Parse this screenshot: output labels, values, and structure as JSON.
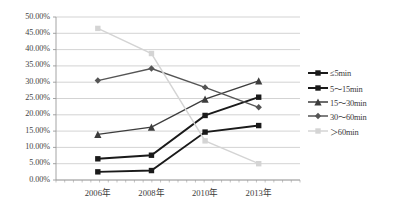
{
  "chart_data": {
    "type": "line",
    "title": "",
    "xlabel": "",
    "ylabel": "",
    "categories": [
      "2006年",
      "2008年",
      "2010年",
      "2013年"
    ],
    "ylim": [
      0,
      50
    ],
    "ytick_labels": [
      "0.00%",
      "5.00%",
      "10.00%",
      "15.00%",
      "20.00%",
      "25.00%",
      "30.00%",
      "35.00%",
      "40.00%",
      "45.00%",
      "50.00%"
    ],
    "ytick_values": [
      0,
      5,
      10,
      15,
      20,
      25,
      30,
      35,
      40,
      45,
      50
    ],
    "grid": true,
    "legend_position": "right",
    "series": [
      {
        "name": "≤5min",
        "values": [
          2.5,
          2.9,
          14.7,
          16.7
        ],
        "color": "#1a1a1a",
        "marker": "square"
      },
      {
        "name": "5～15min",
        "values": [
          6.5,
          7.6,
          19.8,
          25.4
        ],
        "color": "#1a1a1a",
        "marker": "square"
      },
      {
        "name": "15～30min",
        "values": [
          14.0,
          16.2,
          24.8,
          30.4
        ],
        "color": "#3d3d3d",
        "marker": "triangle"
      },
      {
        "name": "30～60min",
        "values": [
          30.5,
          34.2,
          28.4,
          22.3
        ],
        "color": "#555555",
        "marker": "diamond"
      },
      {
        "name": "＞60min",
        "values": [
          46.5,
          38.8,
          12.0,
          5.0
        ],
        "color": "#d4d4d4",
        "marker": "square"
      }
    ]
  },
  "axis": {
    "grid_color": "#c8c8c8",
    "axis_color": "#9a9a9a"
  }
}
